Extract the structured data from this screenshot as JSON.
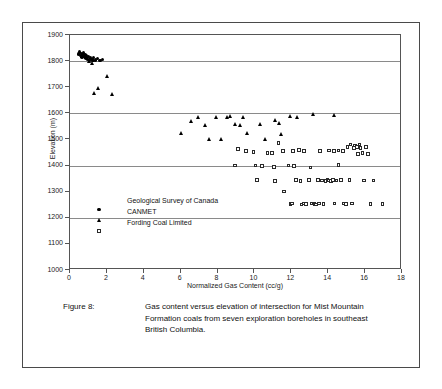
{
  "figure": {
    "caption_label": "Figure 8:",
    "caption_text": "Gas content versus elevation of intersection for Mist Mountain Formation coals from seven exploration boreholes in southeast British Columbia."
  },
  "legend": {
    "position": "inside-lower-left",
    "entries": [
      {
        "label": "Geological Survey of Canada",
        "marker": "circle-marker"
      },
      {
        "label": "CANMET",
        "marker": "triangle-marker"
      },
      {
        "label": "Fording Coal Limited",
        "marker": "square-marker"
      }
    ]
  },
  "chart_data": {
    "type": "scatter",
    "title": "",
    "subtitle": "",
    "xlabel": "Normalized Gas Content (cc/g)",
    "ylabel": "Elevation (m)",
    "xlim": [
      0,
      18
    ],
    "ylim": [
      1000,
      1900
    ],
    "xticks": [
      0,
      2,
      4,
      6,
      8,
      10,
      12,
      14,
      16,
      18
    ],
    "xtick_labels": [
      "0",
      "2",
      "4",
      "6",
      "8",
      "10",
      "12",
      "14",
      "16",
      "18"
    ],
    "yticks": [
      1000,
      1100,
      1200,
      1300,
      1400,
      1500,
      1600,
      1700,
      1800,
      1900
    ],
    "ytick_labels": [
      "1000",
      "1100",
      "1200",
      "1300",
      "1400",
      "1500",
      "1600",
      "1700",
      "1800",
      "1900"
    ],
    "grid": true,
    "gridlines_y": [
      1200,
      1400,
      1600,
      1800
    ],
    "grid_color": "#8a8a8a",
    "marker_color": "#000000",
    "legend_position": "inside lower left",
    "series": [
      {
        "name": "Geological Survey of Canada",
        "marker": "circle",
        "filled": true,
        "points": [
          [
            0.45,
            1828
          ],
          [
            0.52,
            1835
          ],
          [
            0.58,
            1822
          ],
          [
            0.62,
            1830
          ],
          [
            0.66,
            1816
          ],
          [
            0.7,
            1826
          ],
          [
            0.74,
            1833
          ],
          [
            0.78,
            1819
          ],
          [
            0.82,
            1824
          ],
          [
            0.86,
            1812
          ],
          [
            0.9,
            1821
          ],
          [
            0.95,
            1808
          ],
          [
            1.0,
            1817
          ],
          [
            1.05,
            1803
          ],
          [
            1.12,
            1812
          ],
          [
            1.2,
            1806
          ],
          [
            1.28,
            1814
          ],
          [
            1.38,
            1804
          ],
          [
            1.5,
            1809
          ],
          [
            1.62,
            1803
          ],
          [
            1.75,
            1806
          ]
        ]
      },
      {
        "name": "CANMET",
        "marker": "triangle",
        "filled": true,
        "points": [
          [
            1.05,
            1797
          ],
          [
            1.2,
            1792
          ],
          [
            1.25,
            1802
          ],
          [
            1.3,
            1676
          ],
          [
            1.55,
            1694
          ],
          [
            2.05,
            1741
          ],
          [
            2.3,
            1672
          ],
          [
            6.05,
            1524
          ],
          [
            6.6,
            1570
          ],
          [
            6.95,
            1585
          ],
          [
            7.35,
            1555
          ],
          [
            7.55,
            1500
          ],
          [
            7.95,
            1583
          ],
          [
            8.2,
            1502
          ],
          [
            8.55,
            1585
          ],
          [
            8.7,
            1590
          ],
          [
            8.95,
            1556
          ],
          [
            9.25,
            1554
          ],
          [
            9.4,
            1585
          ],
          [
            9.6,
            1522
          ],
          [
            10.3,
            1556
          ],
          [
            10.6,
            1502
          ],
          [
            11.15,
            1572
          ],
          [
            11.35,
            1563
          ],
          [
            11.45,
            1518
          ],
          [
            11.95,
            1588
          ],
          [
            12.35,
            1585
          ],
          [
            13.2,
            1597
          ],
          [
            14.35,
            1592
          ]
        ]
      },
      {
        "name": "Fording Coal Limited",
        "marker": "square",
        "filled": false,
        "points": [
          [
            9.1,
            1463
          ],
          [
            9.55,
            1455
          ],
          [
            10.05,
            1400
          ],
          [
            10.4,
            1398
          ],
          [
            10.7,
            1447
          ],
          [
            11.05,
            1395
          ],
          [
            11.1,
            1340
          ],
          [
            11.3,
            1487
          ],
          [
            11.55,
            1455
          ],
          [
            11.6,
            1300
          ],
          [
            11.85,
            1400
          ],
          [
            11.95,
            1253
          ],
          [
            12.05,
            1255
          ],
          [
            12.1,
            1455
          ],
          [
            12.25,
            1345
          ],
          [
            12.4,
            1460
          ],
          [
            12.5,
            1340
          ],
          [
            12.55,
            1251
          ],
          [
            12.65,
            1255
          ],
          [
            12.8,
            1253
          ],
          [
            12.95,
            1345
          ],
          [
            13.05,
            1393
          ],
          [
            13.1,
            1255
          ],
          [
            13.25,
            1253
          ],
          [
            13.35,
            1251
          ],
          [
            13.45,
            1344
          ],
          [
            13.5,
            1255
          ],
          [
            13.65,
            1342
          ],
          [
            13.75,
            1253
          ],
          [
            13.85,
            1340
          ],
          [
            13.95,
            1345
          ],
          [
            14.05,
            1343
          ],
          [
            14.15,
            1341
          ],
          [
            14.25,
            1345
          ],
          [
            14.35,
            1254
          ],
          [
            14.45,
            1343
          ],
          [
            14.55,
            1402
          ],
          [
            14.7,
            1345
          ],
          [
            14.85,
            1254
          ],
          [
            14.95,
            1253
          ],
          [
            15.05,
            1470
          ],
          [
            15.15,
            1344
          ],
          [
            15.2,
            1480
          ],
          [
            15.3,
            1255
          ],
          [
            15.4,
            1468
          ],
          [
            15.45,
            1477
          ],
          [
            15.55,
            1470
          ],
          [
            15.6,
            1445
          ],
          [
            15.7,
            1480
          ],
          [
            15.75,
            1468
          ],
          [
            15.85,
            1447
          ],
          [
            15.95,
            1343
          ],
          [
            16.05,
            1470
          ],
          [
            16.15,
            1445
          ],
          [
            16.3,
            1253
          ],
          [
            16.45,
            1342
          ],
          [
            16.95,
            1253
          ],
          [
            10.95,
            1448
          ],
          [
            9.95,
            1452
          ],
          [
            12.7,
            1455
          ],
          [
            13.55,
            1455
          ],
          [
            14.05,
            1457
          ],
          [
            14.3,
            1455
          ],
          [
            14.55,
            1458
          ],
          [
            14.8,
            1456
          ],
          [
            12.15,
            1398
          ],
          [
            10.15,
            1345
          ],
          [
            8.95,
            1400
          ]
        ]
      }
    ]
  }
}
